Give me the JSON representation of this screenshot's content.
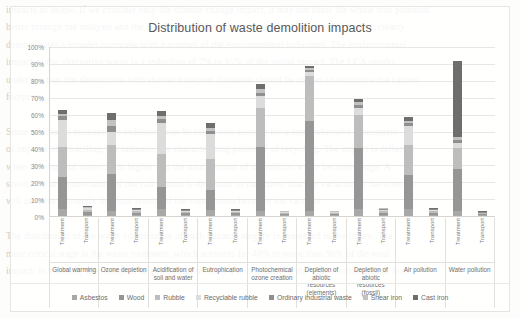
{
  "background_text": "impacts as below. If we consider only the climate change impact, it may not show the whole true potential\nbetter through the analysis and the result. The LCA study using the Eco-indicator 99 method clearly\ndemonstrates a broader overview with a number of the environmental indicators. The environmental\nimpact of the alternative waste is a reduction of 7% to 15% of the initial impact. The LCA results\nunderline that the alternatives with shorter transport distances should be chosen to minimize the carbon\nfootprint.\n\nSome additional measures or indicators can be taken into account for a comprehensive assessment\nof impacts or modelling, for instance, the characterizing potential of recycling. The impact is different\nwhen the share of materials is higher and the total amount of demolition waste becomes large. A\nsensitivity and uncertainty of the calculation is dominant to the extent that the variation of the scenario\nwill influence strongly the final results of the comparison between the variants.\n\nThe distribution of the waste contribution of each impact category is presented in the figure. The\nmost critical stage is the waste treatment, which accounts for 40% to more than 90% of the total\nimpact. In contrast, the transport stage contributes only a minor share of the total environmental load.",
  "chart_data": {
    "type": "bar",
    "subtype": "stacked-bar-percent",
    "title": "Distribution of waste demolition impacts",
    "xlabel": "",
    "ylabel": "",
    "ylim": [
      0,
      100
    ],
    "ytick_labels": [
      "0%",
      "10%",
      "20%",
      "30%",
      "40%",
      "50%",
      "60%",
      "70%",
      "80%",
      "90%",
      "100%"
    ],
    "ytick_values": [
      0,
      10,
      20,
      30,
      40,
      50,
      60,
      70,
      80,
      90,
      100
    ],
    "grid": true,
    "legend_position": "bottom",
    "series": [
      {
        "name": "Asbestos",
        "color": "#a8a8a8"
      },
      {
        "name": "Wood",
        "color": "#969696"
      },
      {
        "name": "Rubble",
        "color": "#bdbdbd"
      },
      {
        "name": "Recyclable rubble",
        "color": "#dcdcdc"
      },
      {
        "name": "Ordinary industrial waste",
        "color": "#8f8f8f"
      },
      {
        "name": "Shear iron",
        "color": "#c2c2c2"
      },
      {
        "name": "Cast iron",
        "color": "#6e6e6e"
      }
    ],
    "categories": [
      "Global warming",
      "Ozone depletion",
      "Acidification of soil and water",
      "Eutrophication",
      "Photochemical ozone creation",
      "Depletion of abiotic resources (elements)",
      "Depletion of abiotic resources (fossil)",
      "Air pollution",
      "Water pollution"
    ],
    "subcategories": [
      "Treatment",
      "Transport"
    ],
    "bars": [
      {
        "category": "Global warming",
        "stage": "Treatment",
        "values": [
          4.0,
          19.0,
          18.0,
          16.0,
          2.0,
          1.5,
          2.0
        ],
        "total": 62.5
      },
      {
        "category": "Global warming",
        "stage": "Transport",
        "values": [
          0.8,
          1.5,
          1.2,
          1.0,
          0.5,
          0.4,
          0.6
        ],
        "total": 6.0
      },
      {
        "category": "Ozone depletion",
        "stage": "Treatment",
        "values": [
          3.0,
          22.0,
          17.0,
          8.0,
          3.0,
          4.0,
          4.0
        ],
        "total": 61.0
      },
      {
        "category": "Ozone depletion",
        "stage": "Transport",
        "values": [
          0.6,
          1.2,
          1.0,
          0.8,
          0.4,
          0.4,
          0.6
        ],
        "total": 5.0
      },
      {
        "category": "Acidification of soil and water",
        "stage": "Treatment",
        "values": [
          4.0,
          13.0,
          20.0,
          18.0,
          2.5,
          1.5,
          3.0
        ],
        "total": 62.0
      },
      {
        "category": "Acidification of soil and water",
        "stage": "Transport",
        "values": [
          0.5,
          1.0,
          0.8,
          0.7,
          0.4,
          0.3,
          0.3
        ],
        "total": 4.0
      },
      {
        "category": "Eutrophication",
        "stage": "Treatment",
        "values": [
          3.5,
          12.0,
          18.0,
          15.0,
          2.0,
          1.5,
          3.0
        ],
        "total": 55.0
      },
      {
        "category": "Eutrophication",
        "stage": "Transport",
        "values": [
          0.5,
          1.0,
          0.8,
          0.7,
          0.4,
          0.3,
          0.3
        ],
        "total": 4.0
      },
      {
        "category": "Photochemical ozone creation",
        "stage": "Treatment",
        "values": [
          3.0,
          38.0,
          23.0,
          7.0,
          2.0,
          2.0,
          3.0
        ],
        "total": 78.0
      },
      {
        "category": "Photochemical ozone creation",
        "stage": "Transport",
        "values": [
          0.4,
          0.8,
          0.6,
          0.5,
          0.3,
          0.2,
          0.2
        ],
        "total": 3.0
      },
      {
        "category": "Depletion of abiotic resources (elements)",
        "stage": "Treatment",
        "values": [
          3.0,
          53.0,
          27.0,
          2.0,
          1.5,
          1.0,
          1.0
        ],
        "total": 88.5
      },
      {
        "category": "Depletion of abiotic resources (elements)",
        "stage": "Transport",
        "values": [
          0.4,
          0.8,
          0.6,
          0.5,
          0.3,
          0.2,
          0.2
        ],
        "total": 3.0
      },
      {
        "category": "Depletion of abiotic resources (fossil)",
        "stage": "Treatment",
        "values": [
          4.0,
          36.0,
          20.0,
          4.0,
          2.0,
          1.5,
          1.5
        ],
        "total": 69.0
      },
      {
        "category": "Depletion of abiotic resources (fossil)",
        "stage": "Transport",
        "values": [
          0.6,
          1.2,
          1.0,
          0.8,
          0.5,
          0.4,
          0.5
        ],
        "total": 5.0
      },
      {
        "category": "Air pollution",
        "stage": "Treatment",
        "values": [
          4.0,
          20.0,
          18.0,
          11.0,
          2.0,
          1.5,
          2.0
        ],
        "total": 58.5
      },
      {
        "category": "Air pollution",
        "stage": "Transport",
        "values": [
          0.6,
          1.2,
          1.0,
          0.8,
          0.4,
          0.4,
          0.6
        ],
        "total": 5.0
      },
      {
        "category": "Water pollution",
        "stage": "Treatment",
        "values": [
          3.0,
          25.0,
          12.0,
          3.0,
          2.0,
          2.0,
          45.0
        ],
        "total": 92.0
      },
      {
        "category": "Water pollution",
        "stage": "Transport",
        "values": [
          0.4,
          0.6,
          0.5,
          0.4,
          0.3,
          0.2,
          0.3
        ],
        "total": 2.7
      }
    ]
  }
}
